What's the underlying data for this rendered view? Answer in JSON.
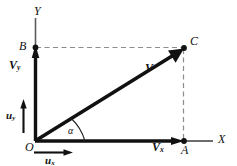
{
  "figure": {
    "kind": "vector-decomposition-diagram",
    "colors": {
      "ink": "#111111",
      "axis": "#555555",
      "dashed": "#8a8a8a",
      "background": "#ffffff"
    },
    "axes": {
      "x_label": "X",
      "y_label": "Y",
      "origin_label": "O"
    },
    "points": [
      {
        "name": "B",
        "label": "B",
        "x": 35,
        "y": 47
      },
      {
        "name": "C",
        "label": "C",
        "x": 184,
        "y": 48
      },
      {
        "name": "A",
        "label": "A",
        "x": 184,
        "y": 141
      },
      {
        "name": "O",
        "label": "O",
        "x": 35,
        "y": 141
      }
    ],
    "vectors": [
      {
        "name": "resultant",
        "label": "V",
        "from": "O",
        "to": "C"
      },
      {
        "name": "y-component",
        "label": "Vy",
        "label_base": "V",
        "label_sub": "y",
        "from": "O",
        "to": "B"
      },
      {
        "name": "x-component",
        "label": "Vx",
        "label_base": "V",
        "label_sub": "x",
        "from": "O",
        "to": "A"
      }
    ],
    "unit_vectors": [
      {
        "name": "u-y",
        "label_base": "u",
        "label_sub": "y",
        "direction": "vertical"
      },
      {
        "name": "u-x",
        "label_base": "u",
        "label_sub": "x",
        "direction": "horizontal"
      }
    ],
    "angle": {
      "name": "alpha",
      "label": "α",
      "between": [
        "x-axis",
        "resultant"
      ]
    },
    "dashed_lines": [
      {
        "name": "b-to-c",
        "from": "B",
        "to": "C"
      },
      {
        "name": "c-to-a",
        "from": "C",
        "to": "A"
      }
    ]
  }
}
